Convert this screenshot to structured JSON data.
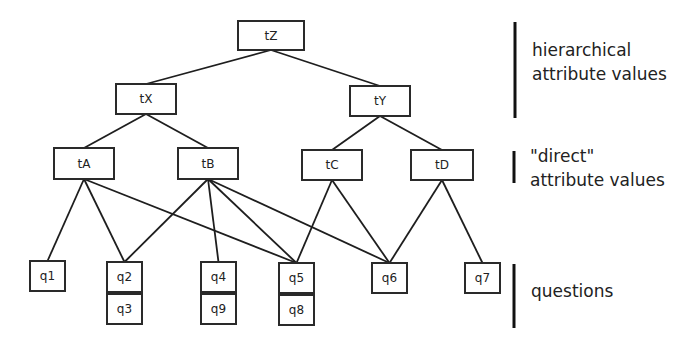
{
  "diagram": {
    "nodes": [
      {
        "id": "tZ",
        "label": "tZ",
        "level": "hierarchical"
      },
      {
        "id": "tX",
        "label": "tX",
        "level": "hierarchical"
      },
      {
        "id": "tY",
        "label": "tY",
        "level": "hierarchical"
      },
      {
        "id": "tA",
        "label": "tA",
        "level": "direct"
      },
      {
        "id": "tB",
        "label": "tB",
        "level": "direct"
      },
      {
        "id": "tC",
        "label": "tC",
        "level": "direct"
      },
      {
        "id": "tD",
        "label": "tD",
        "level": "direct"
      },
      {
        "id": "q1",
        "label": "q1",
        "level": "question"
      },
      {
        "id": "q2",
        "label": "q2",
        "level": "question"
      },
      {
        "id": "q3",
        "label": "q3",
        "level": "question",
        "stacked_under": "q2"
      },
      {
        "id": "q4",
        "label": "q4",
        "level": "question"
      },
      {
        "id": "q9",
        "label": "q9",
        "level": "question",
        "stacked_under": "q4"
      },
      {
        "id": "q5",
        "label": "q5",
        "level": "question"
      },
      {
        "id": "q8",
        "label": "q8",
        "level": "question",
        "stacked_under": "q5"
      },
      {
        "id": "q6",
        "label": "q6",
        "level": "question"
      },
      {
        "id": "q7",
        "label": "q7",
        "level": "question"
      }
    ],
    "edges": [
      {
        "from": "tZ",
        "to": "tX"
      },
      {
        "from": "tZ",
        "to": "tY"
      },
      {
        "from": "tX",
        "to": "tA"
      },
      {
        "from": "tX",
        "to": "tB"
      },
      {
        "from": "tY",
        "to": "tC"
      },
      {
        "from": "tY",
        "to": "tD"
      },
      {
        "from": "tA",
        "to": "q1"
      },
      {
        "from": "tA",
        "to": "q2"
      },
      {
        "from": "tA",
        "to": "q5"
      },
      {
        "from": "tB",
        "to": "q2"
      },
      {
        "from": "tB",
        "to": "q4"
      },
      {
        "from": "tB",
        "to": "q5"
      },
      {
        "from": "tB",
        "to": "q6"
      },
      {
        "from": "tC",
        "to": "q5"
      },
      {
        "from": "tC",
        "to": "q6"
      },
      {
        "from": "tD",
        "to": "q6"
      },
      {
        "from": "tD",
        "to": "q7"
      }
    ]
  },
  "legend": [
    {
      "id": "hierarchical",
      "lines": [
        "hierarchical",
        "attribute values"
      ]
    },
    {
      "id": "direct",
      "lines": [
        "\"direct\"",
        "attribute values"
      ]
    },
    {
      "id": "questions",
      "lines": [
        "questions"
      ]
    }
  ],
  "colors": {
    "stroke": "#1e1e1e",
    "fill": "#ffffff",
    "text": "#222222"
  }
}
